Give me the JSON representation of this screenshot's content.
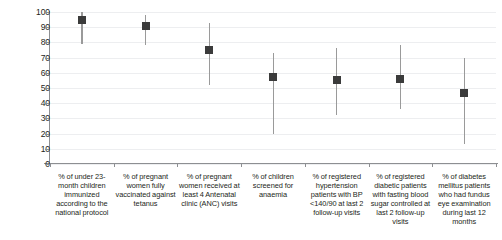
{
  "chart_data": {
    "type": "scatter",
    "title": "",
    "subtitle": "",
    "xlabel": "",
    "ylabel": "",
    "ylim": [
      0,
      100
    ],
    "yticks": [
      0,
      10,
      20,
      30,
      40,
      50,
      60,
      70,
      80,
      90,
      100
    ],
    "grid": true,
    "legend": null,
    "marker_style": "filled-square-with-vertical-range-bar",
    "series_name": "Median percentage with range",
    "categories": [
      "% of under 23-month children immunized according to the national protocol",
      "% of pregnant women fully vaccinated against tetanus",
      "% of pregnant women received at least 4 Antenatal clinic (ANC) visits",
      "% of children screened for anaemia",
      "% of registered hypertension patients with BP <140/90 at last 2 follow-up visits",
      "% of registered diabetic patients with fasting blood sugar controlled at last 2 follow-up visits",
      "% of diabetes mellitus patients who had fundus eye examination during last 12 months"
    ],
    "values": [
      95,
      91,
      75,
      57,
      55,
      56,
      47
    ],
    "range_low": [
      79,
      78,
      52,
      20,
      32,
      36,
      13
    ],
    "range_high": [
      100,
      98,
      93,
      73,
      76,
      78,
      70
    ],
    "colors": {
      "marker": "#3b3b3b",
      "whisker": "#9a9a9a",
      "gridline": "#edeef0",
      "axis": "#8d8f92",
      "text": "#231f20",
      "background": "#ffffff"
    }
  }
}
